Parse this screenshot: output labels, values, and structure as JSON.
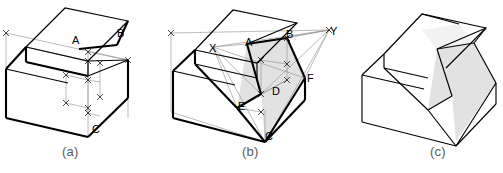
{
  "figure": {
    "type": "isometric-construction-drawing",
    "panels": [
      {
        "id": "a",
        "caption": "(a)",
        "caption_x": 71,
        "caption_y": 151,
        "description": "Stepped isometric block with light construction and dimension lines locating points A, B and C",
        "point_labels": [
          {
            "text": "A",
            "x": 72,
            "y": 44
          },
          {
            "text": "B",
            "x": 117,
            "y": 37
          },
          {
            "text": "C",
            "x": 92,
            "y": 133
          }
        ]
      },
      {
        "id": "b",
        "caption": "(b)",
        "caption_x": 250,
        "caption_y": 151,
        "description": "Same block with construction rays to vanishing points X and Y locating cut-plane vertices A, B, C, D, E, F; cut face shaded",
        "point_labels": [
          {
            "text": "X",
            "x": 209,
            "y": 52
          },
          {
            "text": "A",
            "x": 245,
            "y": 46
          },
          {
            "text": "B",
            "x": 286,
            "y": 38
          },
          {
            "text": "Y",
            "x": 330,
            "y": 35
          },
          {
            "text": "F",
            "x": 307,
            "y": 82
          },
          {
            "text": "D",
            "x": 272,
            "y": 95
          },
          {
            "text": "E",
            "x": 238,
            "y": 110
          },
          {
            "text": "C",
            "x": 265,
            "y": 140
          }
        ]
      },
      {
        "id": "c",
        "caption": "(c)",
        "caption_x": 438,
        "caption_y": 151,
        "description": "Completed isometric solid with the inclined cut face shaded",
        "point_labels": []
      }
    ],
    "colors": {
      "outline": "#000000",
      "construction_line": "#8d8d8d",
      "shaded_face": "#e2e2e2",
      "caption_text": "#5a5a5a",
      "background": "#ffffff"
    }
  }
}
